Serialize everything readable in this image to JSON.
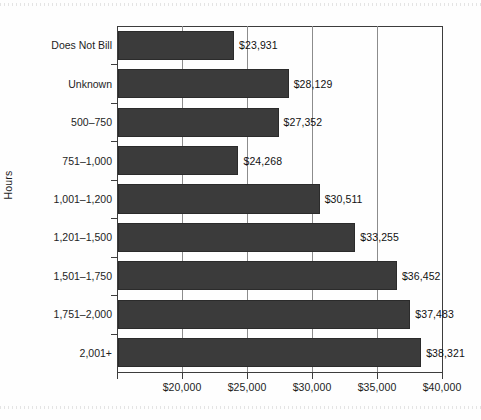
{
  "chart_data": {
    "type": "bar",
    "orientation": "horizontal",
    "title": "",
    "xlabel": "",
    "ylabel": "Hours",
    "xlim": [
      15000,
      40000
    ],
    "xticks": [
      "$20,000",
      "$25,000",
      "$30,000",
      "$35,000",
      "$40,000"
    ],
    "xtick_values": [
      20000,
      25000,
      30000,
      35000,
      40000
    ],
    "grid": true,
    "grid_axis": "x",
    "legend": "none",
    "bar_color": "#3b3b3b",
    "categories": [
      "Does Not Bill",
      "Unknown",
      "500–750",
      "751–1,000",
      "1,001–1,200",
      "1,201–1,500",
      "1,501–1,750",
      "1,751–2,000",
      "2,001+"
    ],
    "values": [
      23931,
      28129,
      27352,
      24268,
      30511,
      33255,
      36452,
      37483,
      38321
    ],
    "value_labels": [
      "$23,931",
      "$28,129",
      "$27,352",
      "$24,268",
      "$30,511",
      "$33,255",
      "$36,452",
      "$37,483",
      "$38,321"
    ]
  }
}
